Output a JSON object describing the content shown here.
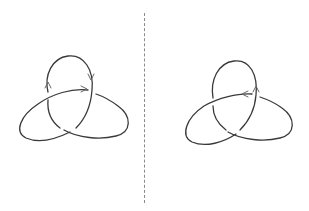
{
  "figure": {
    "colors": {
      "background": "#ffffff",
      "stroke": "#3a3a3a",
      "arrow": "#666666",
      "divider": "#8a8a8a"
    },
    "panels": [
      {
        "id": "left",
        "label": "",
        "knot": "trefoil",
        "orientation_arrows": [
          {
            "position": "left side of top loop",
            "direction": "up"
          },
          {
            "position": "right side of top loop",
            "direction": "down"
          },
          {
            "position": "crossing strand inside top loop",
            "direction": "right"
          }
        ]
      },
      {
        "id": "right",
        "label": "",
        "knot": "trefoil",
        "orientation_arrows": [
          {
            "position": "right side of top loop",
            "direction": "up"
          },
          {
            "position": "crossing strand inside top loop",
            "direction": "left"
          }
        ]
      }
    ],
    "divider": {
      "style": "dashed",
      "orientation": "vertical"
    }
  }
}
